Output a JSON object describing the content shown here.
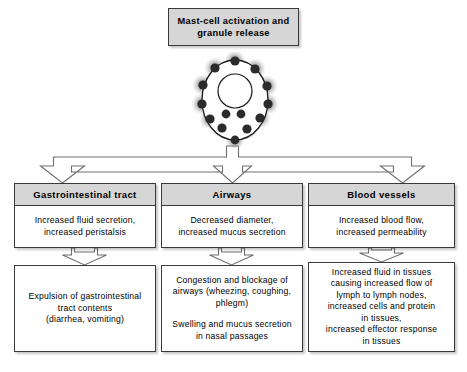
{
  "title_box": {
    "line1": "Mast-cell activation and",
    "line2": "granule release"
  },
  "figure": {
    "name": "mast-cell-granule-release-illustration",
    "granule_count": 14,
    "colors": {
      "granule": "#2b2b2b",
      "halo": "#9a9a9a",
      "cell_fill": "#ffffff",
      "cell_outline": "#1a1a1a"
    }
  },
  "colors": {
    "header_fill": "#d6d6d6",
    "box_fill": "#ffffff",
    "border": "#3a3a3a",
    "text": "#000000"
  },
  "columns": [
    {
      "key": "gastrointestinal",
      "header": "Gastrointestinal tract",
      "response": {
        "line1": "Increased fluid secretion,",
        "line2": "increased peristalsis"
      },
      "effects": [
        {
          "line1": "Expulsion of gastrointestinal",
          "line2": "tract contents",
          "line3": "(diarrhea,  vomiting)"
        }
      ]
    },
    {
      "key": "airways",
      "header": "Airways",
      "response": {
        "line1": "Decreased diameter,",
        "line2": "increased mucus secretion"
      },
      "effects": [
        {
          "line1": "Congestion and blockage of",
          "line2": "airways (wheezing, coughing,",
          "line3": "phlegm)"
        },
        {
          "line1": "Swelling and mucus secretion",
          "line2": "in nasal passages"
        }
      ]
    },
    {
      "key": "blood-vessels",
      "header": "Blood vessels",
      "response": {
        "line1": "Increased blood flow,",
        "line2": "increased permeability"
      },
      "effects": [
        {
          "line1": "Increased fluid in tissues",
          "line2": "causing increased flow of",
          "line3": "lymph to lymph nodes,",
          "line4": "increased cells and protein",
          "line5": "in tissues,",
          "line6": "increased effector response",
          "line7": "in tissues"
        }
      ]
    }
  ]
}
